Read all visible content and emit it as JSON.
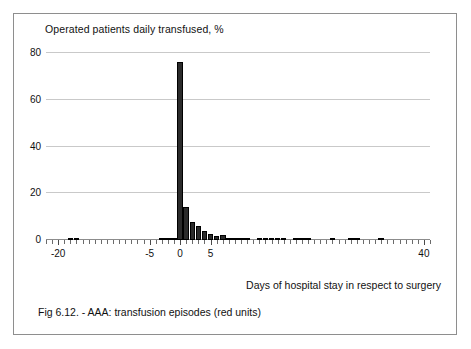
{
  "figure": {
    "caption": "Fig 6.12. - AAA: transfusion episodes (red units)",
    "border_color": "#8e8e8e"
  },
  "chart_data": {
    "type": "bar",
    "title": "Operated patients daily transfused, %",
    "xlabel": "Days of hospital stay in respect to surgery",
    "ylabel": "Operated patients daily transfused, %",
    "xlim": [
      -22,
      41
    ],
    "ylim": [
      0,
      80
    ],
    "yticks": [
      0,
      20,
      40,
      60,
      80
    ],
    "ytick_labels": [
      "0",
      "20",
      "40",
      "60",
      "80"
    ],
    "xticks": [
      -20,
      -5,
      0,
      5,
      40
    ],
    "xtick_labels": [
      "-20",
      "-5",
      "0",
      "5",
      "40"
    ],
    "xtick_minor_step": 1,
    "grid": "horizontal",
    "legend": "none",
    "bar_color": "#2b2b2b",
    "bar_edge_color": "#000000",
    "x": [
      -21,
      -20,
      -19,
      -18,
      -17,
      -16,
      -15,
      -14,
      -13,
      -12,
      -11,
      -10,
      -9,
      -8,
      -7,
      -6,
      -5,
      -4,
      -3,
      -2,
      -1,
      0,
      1,
      2,
      3,
      4,
      5,
      6,
      7,
      8,
      9,
      10,
      11,
      12,
      13,
      14,
      15,
      16,
      17,
      18,
      19,
      20,
      21,
      22,
      23,
      24,
      25,
      26,
      27,
      28,
      29,
      30,
      31,
      32,
      33,
      34,
      35,
      36,
      37,
      38,
      39,
      40
    ],
    "values": [
      0,
      0,
      0,
      1.0,
      1.0,
      0,
      0,
      0,
      0,
      0,
      0,
      0,
      0,
      0,
      0,
      0,
      0,
      0,
      0.4,
      0.4,
      0.6,
      76.0,
      14.0,
      7.5,
      6.0,
      4.0,
      2.4,
      1.6,
      2.0,
      0.8,
      0.5,
      0.5,
      0.4,
      0,
      0.4,
      0.4,
      0.4,
      0.4,
      0.4,
      0,
      0.4,
      0.4,
      0.4,
      0,
      0,
      0,
      0.4,
      0,
      0,
      0.9,
      0.9,
      0,
      0,
      0,
      0.5,
      0,
      0,
      0,
      0,
      0,
      0,
      0
    ],
    "peak": {
      "day": 0,
      "value": 76.0
    }
  }
}
